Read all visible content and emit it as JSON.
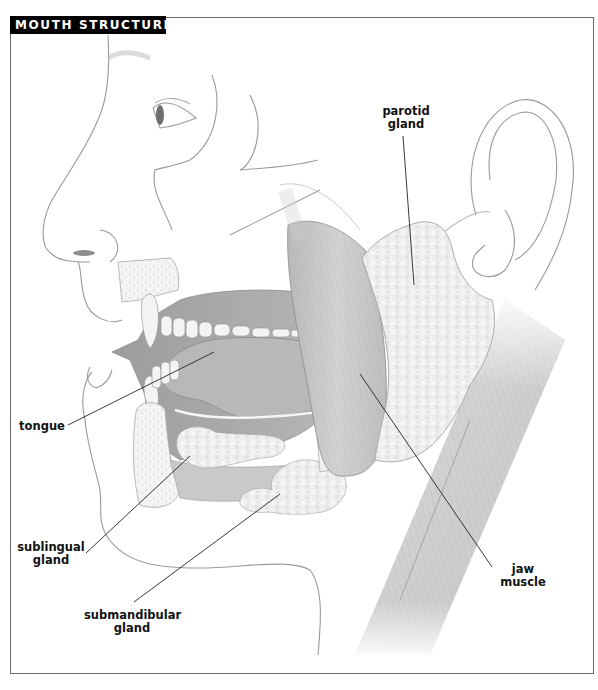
{
  "title": "MOUTH STRUCTURE",
  "labels": {
    "parotid": {
      "line1": "parotid",
      "line2": "gland"
    },
    "tongue": {
      "line1": "tongue"
    },
    "sublingual": {
      "line1": "sublingual",
      "line2": "gland"
    },
    "submandibular": {
      "line1": "submandibular",
      "line2": "gland"
    },
    "jaw_muscle": {
      "line1": "jaw",
      "line2": "muscle"
    }
  },
  "colors": {
    "title_bg": "#000000",
    "title_text": "#ffffff",
    "frame": "#6a6a6a",
    "sketch_line": "#9a9a9a",
    "leader_line": "#222222",
    "gland_fill": "#f2f2f2",
    "muscle_fill": "#c8c8c8",
    "mouth_cavity": "#a9a9a9"
  }
}
